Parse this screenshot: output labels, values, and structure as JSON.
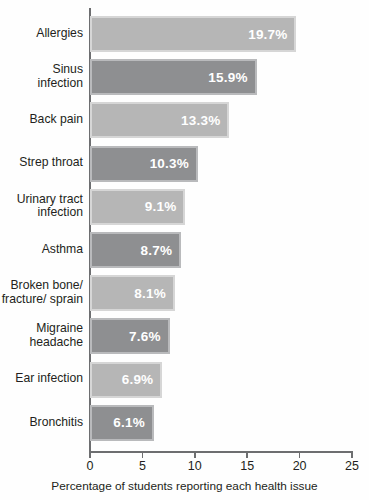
{
  "chart_data": {
    "type": "bar",
    "orientation": "horizontal",
    "title": "",
    "xlabel": "Percentage of students reporting each health issue",
    "ylabel": "",
    "xlim": [
      0,
      25
    ],
    "xticks": [
      0,
      5,
      10,
      15,
      20,
      25
    ],
    "xtick_labels": [
      "0",
      "5",
      "10",
      "15",
      "20",
      "25"
    ],
    "grid": false,
    "legend": null,
    "categories": [
      "Allergies",
      "Sinus\ninfection",
      "Back pain",
      "Strep throat",
      "Urinary tract\ninfection",
      "Asthma",
      "Broken bone/\nfracture/ sprain",
      "Migraine\nheadache",
      "Ear infection",
      "Bronchitis"
    ],
    "values": [
      19.7,
      15.9,
      13.3,
      10.3,
      9.1,
      8.7,
      8.1,
      7.6,
      6.9,
      6.1
    ],
    "value_labels": [
      "19.7%",
      "15.9%",
      "13.3%",
      "10.3%",
      "9.1%",
      "8.7%",
      "8.1%",
      "7.6%",
      "6.9%",
      "6.1%"
    ],
    "bar_styles": [
      "light",
      "dark",
      "light",
      "dark",
      "light",
      "dark",
      "light",
      "dark",
      "light",
      "dark"
    ]
  },
  "colors": {
    "bar_light_fill": "#b6b6b6",
    "bar_light_border": "#d6d6d6",
    "bar_dark_fill": "#8e8f91",
    "bar_dark_border": "#b9babc",
    "axis": "#6d6e70",
    "text": "#231f20",
    "value_text": "#ffffff",
    "background": "#fefefe"
  }
}
